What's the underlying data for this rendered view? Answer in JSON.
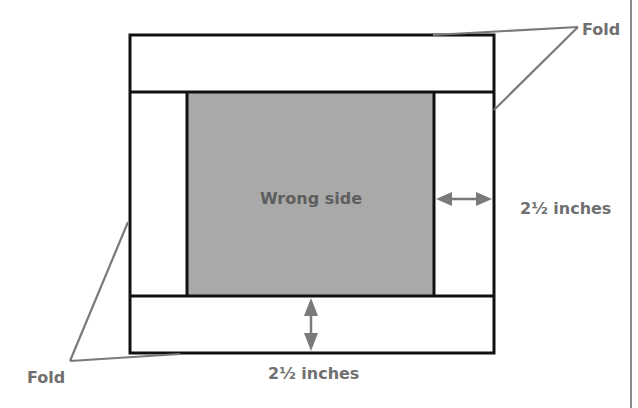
{
  "diagram": {
    "center_label": "Wrong side",
    "fold_label_top": "Fold",
    "fold_label_bottom": "Fold",
    "measure_right": "2½ inches",
    "measure_bottom": "2½ inches",
    "colors": {
      "outline": "#111111",
      "fill_wrong_side": "#a9a9a9",
      "leader_line": "#7a7a7a",
      "arrow": "#7a7a7a",
      "text": "#707070",
      "page_rule": "#8a8a8a"
    }
  }
}
